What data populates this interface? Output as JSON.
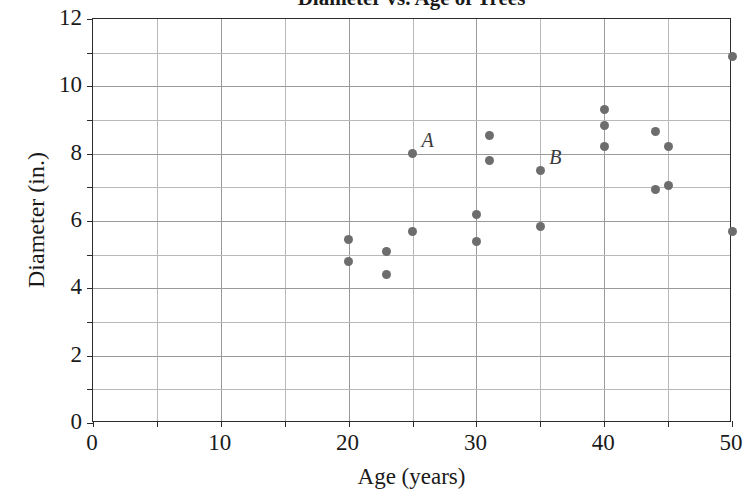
{
  "chart_data": {
    "type": "scatter",
    "title": "Diameter vs. Age of Trees",
    "xlabel": "Age (years)",
    "ylabel": "Diameter (in.)",
    "xlim": [
      0,
      50
    ],
    "ylim": [
      0,
      12
    ],
    "xticks": [
      0,
      10,
      20,
      30,
      40,
      50
    ],
    "yticks": [
      0,
      2,
      4,
      6,
      8,
      10,
      12
    ],
    "xtick_labels": [
      "0",
      "10",
      "20",
      "30",
      "40",
      "50"
    ],
    "ytick_labels": [
      "0",
      "2",
      "4",
      "6",
      "8",
      "10",
      "12"
    ],
    "x_minor_step": 5,
    "y_minor_step": 1,
    "grid": true,
    "legend": "none",
    "marker_color": "#6d6d6d",
    "grid_color": "#b9b9b9",
    "axis_color": "#2b2b2b",
    "points": [
      {
        "x": 20,
        "y": 5.45,
        "label": ""
      },
      {
        "x": 20,
        "y": 4.8,
        "label": ""
      },
      {
        "x": 23,
        "y": 5.1,
        "label": ""
      },
      {
        "x": 23,
        "y": 4.4,
        "label": ""
      },
      {
        "x": 25,
        "y": 5.7,
        "label": ""
      },
      {
        "x": 25,
        "y": 8.0,
        "label": "A"
      },
      {
        "x": 30,
        "y": 6.2,
        "label": ""
      },
      {
        "x": 30,
        "y": 5.4,
        "label": ""
      },
      {
        "x": 31,
        "y": 8.55,
        "label": ""
      },
      {
        "x": 31,
        "y": 7.8,
        "label": ""
      },
      {
        "x": 35,
        "y": 7.5,
        "label": "B"
      },
      {
        "x": 35,
        "y": 5.85,
        "label": ""
      },
      {
        "x": 40,
        "y": 9.3,
        "label": ""
      },
      {
        "x": 40,
        "y": 8.85,
        "label": ""
      },
      {
        "x": 40,
        "y": 8.2,
        "label": ""
      },
      {
        "x": 44,
        "y": 8.65,
        "label": ""
      },
      {
        "x": 44,
        "y": 6.95,
        "label": ""
      },
      {
        "x": 45,
        "y": 8.2,
        "label": ""
      },
      {
        "x": 45,
        "y": 7.05,
        "label": ""
      },
      {
        "x": 50,
        "y": 10.9,
        "label": ""
      },
      {
        "x": 50,
        "y": 5.7,
        "label": ""
      }
    ],
    "annotations": [
      {
        "text": "A",
        "x": 25,
        "y": 8.0
      },
      {
        "text": "B",
        "x": 35,
        "y": 7.5
      }
    ]
  }
}
